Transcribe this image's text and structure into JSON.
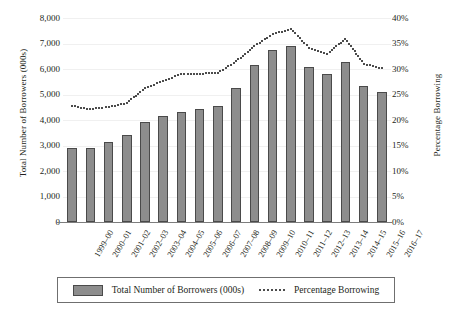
{
  "chart_data": {
    "type": "bar",
    "title": "",
    "xlabel": "",
    "ylabel": "Total Number of Borrowers (000s)",
    "y2label": "Percentage Borrowing",
    "grid": true,
    "legend_position": "bottom",
    "ylim": [
      0,
      8000
    ],
    "y2lim": [
      0,
      40
    ],
    "ytick_labels": [
      "8,000",
      "7,000",
      "6,000",
      "5,000",
      "4,000",
      "3,000",
      "2,000",
      "1,000",
      "0"
    ],
    "ytick_values": [
      8000,
      7000,
      6000,
      5000,
      4000,
      3000,
      2000,
      1000,
      0
    ],
    "y2tick_labels": [
      "40%",
      "35%",
      "30%",
      "25%",
      "20%",
      "15%",
      "10%",
      "5%",
      "0%"
    ],
    "y2tick_values": [
      40,
      35,
      30,
      25,
      20,
      15,
      10,
      5,
      0
    ],
    "categories": [
      "1999–00",
      "2000–01",
      "2001–02",
      "2002–03",
      "2003–04",
      "2004–05",
      "2005–06",
      "2006–07",
      "2007–08",
      "2008–09",
      "2009–10",
      "2010–11",
      "2011–12",
      "2012–13",
      "2013–14",
      "2014–15",
      "2015–16",
      "2016–17"
    ],
    "series": [
      {
        "name": "Total Number of Borrowers (000s)",
        "type": "bar",
        "axis": "left",
        "color": "#8d8d8d",
        "values": [
          2920,
          2890,
          3140,
          3420,
          3910,
          4150,
          4330,
          4420,
          4550,
          5250,
          6150,
          6750,
          6900,
          6080,
          5800,
          6270,
          5320,
          5100
        ]
      },
      {
        "name": "Percentage Borrowing",
        "type": "line",
        "style": "dotted",
        "axis": "right",
        "color": "#101010",
        "values": [
          22.8,
          22.1,
          22.6,
          23.3,
          26.3,
          27.6,
          29.0,
          29.1,
          29.2,
          31.5,
          34.5,
          36.8,
          37.9,
          34.2,
          33.0,
          35.9,
          31.0,
          30.1
        ]
      }
    ]
  },
  "legend": {
    "bar_label": "Total Number of Borrowers (000s)",
    "line_label": "Percentage Borrowing"
  }
}
